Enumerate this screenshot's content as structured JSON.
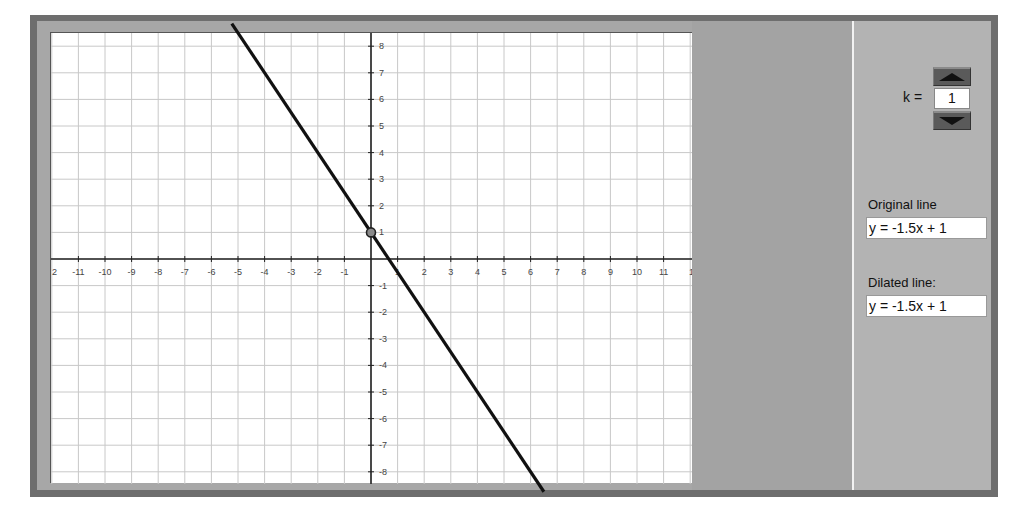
{
  "app": {
    "title": "Dilation of a Line"
  },
  "controls": {
    "k_label": "k =",
    "k_value": "1",
    "up_button_icon": "triangle-up-icon",
    "down_button_icon": "triangle-down-icon"
  },
  "original": {
    "label": "Original line",
    "equation": "y = -1.5x + 1"
  },
  "dilated": {
    "label": "Dilated line:",
    "equation": "y = -1.5x + 1"
  },
  "colors": {
    "frame_dark": "#6e6e6e",
    "frame_light": "#a7a7a7",
    "mid_panel": "#a3a3a3",
    "side_panel": "#b3b3b3",
    "grid": "#c8c8c8",
    "axis": "#222222",
    "line": "#111111"
  },
  "chart_data": {
    "type": "line",
    "title": "",
    "xlabel": "",
    "ylabel": "",
    "xlim": [
      -12,
      12
    ],
    "ylim": [
      -8.5,
      8.5
    ],
    "grid": true,
    "x_tick_labels": [
      "2",
      "-11",
      "-10",
      "-9",
      "-8",
      "-7",
      "-6",
      "-5",
      "-4",
      "-3",
      "-2",
      "-1",
      "2",
      "3",
      "4",
      "5",
      "6",
      "7",
      "8",
      "9",
      "10",
      "11",
      "1"
    ],
    "x_ticks": [
      -11,
      -10,
      -9,
      -8,
      -7,
      -6,
      -5,
      -4,
      -3,
      -2,
      -1,
      1,
      2,
      3,
      4,
      5,
      6,
      7,
      8,
      9,
      10,
      11
    ],
    "y_ticks": [
      8,
      7,
      6,
      5,
      4,
      3,
      2,
      1,
      -1,
      -2,
      -3,
      -4,
      -5,
      -6,
      -7,
      -8
    ],
    "series": [
      {
        "name": "y = -1.5x + 1",
        "slope": -1.5,
        "intercept": 1,
        "points": [
          [
            -5.2,
            8.8
          ],
          [
            0,
            1
          ],
          [
            6.4,
            -8.6
          ]
        ]
      }
    ],
    "highlight_point": {
      "x": 0,
      "y": 1
    }
  }
}
